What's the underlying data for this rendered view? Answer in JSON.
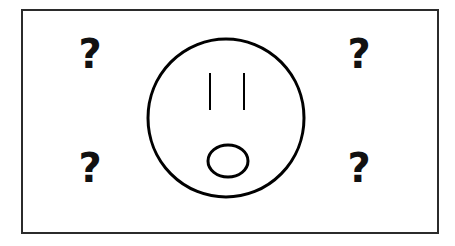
{
  "canvas": {
    "width": 455,
    "height": 246,
    "background_color": "#ffffff"
  },
  "illustration": {
    "title": "confused-face-with-question-marks",
    "description": "Line drawing of a round face with two vertical line eyes and a small oval mouth, surrounded by four bold question marks inside a thin rectangular frame",
    "frame": {
      "name": "outer-frame",
      "x": 22,
      "y": 10,
      "width": 416,
      "height": 223,
      "stroke_color": "#2b2b2b",
      "stroke_width": 2,
      "fill": "none"
    },
    "face": {
      "name": "face-outline",
      "center_x": 226,
      "center_y": 118,
      "radius_x": 78,
      "radius_y": 79,
      "stroke_color": "#000000",
      "stroke_width": 3,
      "fill": "none"
    },
    "eyes": [
      {
        "name": "left-eye",
        "x": 210,
        "y1": 73,
        "y2": 110,
        "stroke_color": "#000000",
        "stroke_width": 2
      },
      {
        "name": "right-eye",
        "x": 244,
        "y1": 73,
        "y2": 110,
        "stroke_color": "#000000",
        "stroke_width": 2
      }
    ],
    "mouth": {
      "name": "mouth-oval",
      "center_x": 228,
      "center_y": 161,
      "radius_x": 20,
      "radius_y": 16,
      "stroke_color": "#000000",
      "stroke_width": 3,
      "fill": "none"
    },
    "question_marks": [
      {
        "name": "question-mark-top-left",
        "glyph": "?",
        "x": 90,
        "y": 68,
        "font_size": 40,
        "color": "#111111"
      },
      {
        "name": "question-mark-top-right",
        "glyph": "?",
        "x": 359,
        "y": 68,
        "font_size": 40,
        "color": "#111111"
      },
      {
        "name": "question-mark-bottom-left",
        "glyph": "?",
        "x": 90,
        "y": 182,
        "font_size": 40,
        "color": "#111111"
      },
      {
        "name": "question-mark-bottom-right",
        "glyph": "?",
        "x": 359,
        "y": 182,
        "font_size": 40,
        "color": "#111111"
      }
    ]
  }
}
